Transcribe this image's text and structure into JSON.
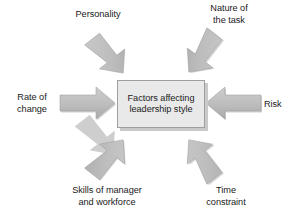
{
  "diagram": {
    "title": "Factors affecting leadership style",
    "type": "radial-influence-diagram",
    "background_color": "#ffffff",
    "center": {
      "text": "Factors affecting\nleadership style",
      "fill_color": "#e9e9e9",
      "border_color": "#9e9e9e",
      "shadow_color": "#c9c9c9",
      "text_color": "#1c1c1c"
    },
    "arrow_color": "#bcbcbc",
    "arrow_shadow_color": "#a8a8a8",
    "nodes": [
      {
        "id": "personality",
        "label": "Personality",
        "position": "top-left",
        "arrow_direction": "down-right"
      },
      {
        "id": "nature-of-the-task",
        "label": "Nature of\nthe task",
        "position": "top-right",
        "arrow_direction": "down-left"
      },
      {
        "id": "rate-of-change",
        "label": "Rate of\nchange",
        "position": "left",
        "arrow_direction": "right"
      },
      {
        "id": "risk",
        "label": "Risk",
        "position": "right",
        "arrow_direction": "left"
      },
      {
        "id": "skills-of-manager-and-workforce",
        "label": "Skills of manager\nand workforce",
        "position": "bottom-left",
        "arrow_direction": "up-right"
      },
      {
        "id": "time-constraint",
        "label": "Time\nconstraint",
        "position": "bottom-right",
        "arrow_direction": "up-left"
      }
    ]
  }
}
